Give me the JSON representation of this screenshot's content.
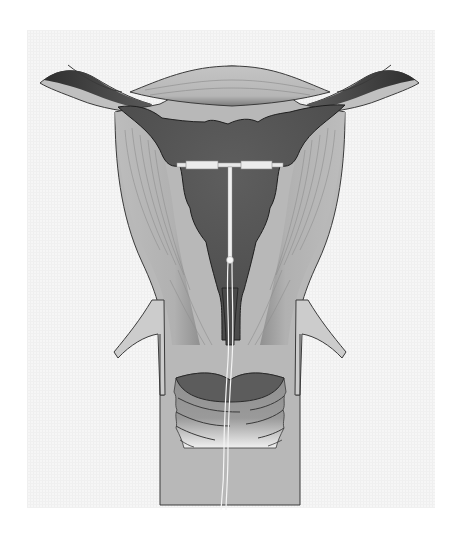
{
  "illustration": {
    "subject": "uterus-cross-section-with-iud",
    "style": "grayscale-medical-illustration",
    "colors": {
      "background": "#ffffff",
      "panel": "#f4f4f4",
      "outline": "#3a3a3a",
      "muscle_wall": "#b4b4b4",
      "muscle_wall_light": "#c8c8c8",
      "cavity": "#5a5a5a",
      "cavity_dark": "#4a4a4a",
      "fallopian_dark": "#555555",
      "cervix_rings": "#8a8a8a",
      "iud": "#f2f2f2",
      "iud_arm_tubes": "#e6e6e6"
    },
    "parts": [
      "left-fallopian-tube",
      "right-fallopian-tube",
      "uterine-fundus",
      "uterine-wall",
      "uterine-cavity",
      "iud-t-frame",
      "iud-strings",
      "cervical-canal",
      "cervix",
      "vaginal-wall"
    ]
  }
}
